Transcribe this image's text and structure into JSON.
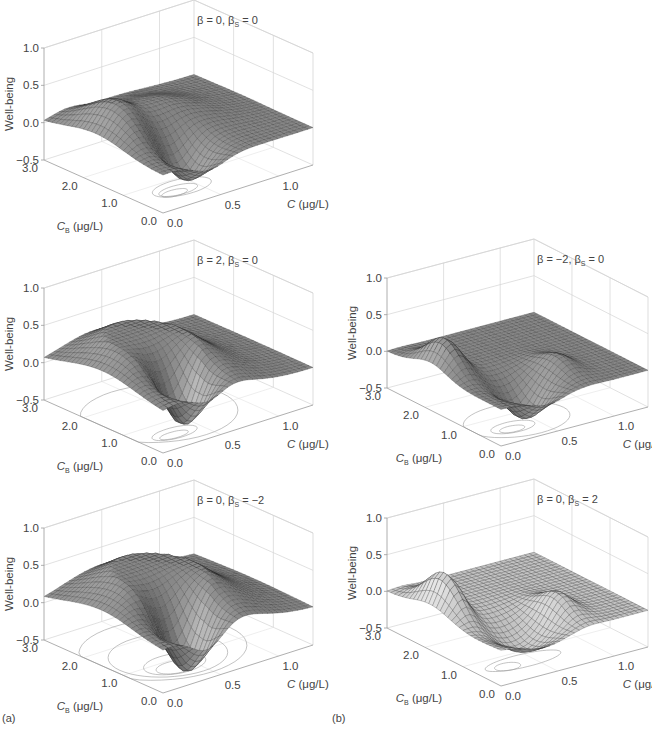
{
  "figure": {
    "labels": {
      "a": "(a)",
      "b": "(b)"
    }
  },
  "chart_data": [
    {
      "id": "a1",
      "type": "surface3d",
      "panel": "a",
      "title": "β = 0, βS = 0",
      "beta": 0,
      "beta_s": 0,
      "zlabel": "Well-being",
      "xlabel": "C (μg/L)",
      "ylabel": "CB (μg/L)",
      "zticks": [
        "1.0",
        "0.5",
        "0.0",
        "−0.5"
      ],
      "xticks": [
        "0.0",
        "0.5",
        "1.0"
      ],
      "yticks": [
        "0.0",
        "1.0",
        "2.0",
        "3.0"
      ],
      "zlim": [
        -0.5,
        1.0
      ],
      "xlim": [
        0,
        1.3
      ],
      "ylim": [
        0,
        3.0
      ],
      "features": "central ridge up to ~0.4 along back, deep trough to ~-0.45 at front centre",
      "contours": "flat ellipses near front-left of floor"
    },
    {
      "id": "a2",
      "type": "surface3d",
      "panel": "a",
      "title": "β = 2, βS = 0",
      "beta": 2,
      "beta_s": 0,
      "zlabel": "Well-being",
      "xlabel": "C (μg/L)",
      "ylabel": "CB (μg/L)",
      "zticks": [
        "1.0",
        "0.5",
        "0.0",
        "−0.5"
      ],
      "xticks": [
        "0.0",
        "0.5",
        "1.0"
      ],
      "yticks": [
        "0.0",
        "1.0",
        "2.0",
        "3.0"
      ],
      "zlim": [
        -0.5,
        1.0
      ],
      "xlim": [
        0,
        1.3
      ],
      "ylim": [
        0,
        3.0
      ],
      "features": "plateau ~0.45 with trough ~-0.45 at front centre",
      "contours": "large ellipse plus nested curves near front-left"
    },
    {
      "id": "a3",
      "type": "surface3d",
      "panel": "a",
      "title": "β = 0, βS = −2",
      "beta": 0,
      "beta_s": -2,
      "zlabel": "Well-being",
      "xlabel": "C (μg/L)",
      "ylabel": "CB (μg/L)",
      "zticks": [
        "1.0",
        "0.5",
        "0.0",
        "−0.5"
      ],
      "xticks": [
        "0.0",
        "0.5",
        "1.0"
      ],
      "yticks": [
        "0.0",
        "1.0",
        "2.0",
        "3.0"
      ],
      "zlim": [
        -0.5,
        1.0
      ],
      "xlim": [
        0,
        1.3
      ],
      "ylim": [
        0,
        3.0
      ],
      "features": "broad dome ~0.5 with trough ~-0.45 at front centre",
      "contours": "concentric ellipses on floor"
    },
    {
      "id": "b1",
      "type": "surface3d",
      "panel": "b",
      "title": "β = −2, βS = 0",
      "beta": -2,
      "beta_s": 0,
      "zlabel": "Well-being",
      "xlabel": "C (μg/L)",
      "ylabel": "CB (μg/L)",
      "zticks": [
        "1.0",
        "0.5",
        "0.0",
        "−0.5"
      ],
      "xticks": [
        "0.0",
        "0.5",
        "1.0"
      ],
      "yticks": [
        "0.0",
        "1.0",
        "2.0",
        "3.0"
      ],
      "zlim": [
        -0.5,
        1.0
      ],
      "xlim": [
        0,
        1.3
      ],
      "ylim": [
        0,
        3.0
      ],
      "features": "left peak ~0.4, right smaller peak ~0.1, trough ~-0.45 at front centre",
      "contours": "narrow nested curves near front-left"
    },
    {
      "id": "b2",
      "type": "surface3d",
      "panel": "b",
      "title": "β = 0, βS = 2",
      "beta": 0,
      "beta_s": 2,
      "zlabel": "Well-being",
      "xlabel": "C (μg/L)",
      "ylabel": "CB (μg/L)",
      "zticks": [
        "1.0",
        "0.5",
        "0.0",
        "−0.5"
      ],
      "xticks": [
        "0.0",
        "0.5",
        "1.0"
      ],
      "yticks": [
        "0.0",
        "1.0",
        "2.0",
        "3.0"
      ],
      "zlim": [
        -0.5,
        1.0
      ],
      "xlim": [
        0,
        1.3
      ],
      "ylim": [
        0,
        3.0
      ],
      "features": "two peaks (left ~0.45, right ~0.2) with shallow trough ~-0.35 between",
      "contours": "faint curves near front"
    }
  ]
}
